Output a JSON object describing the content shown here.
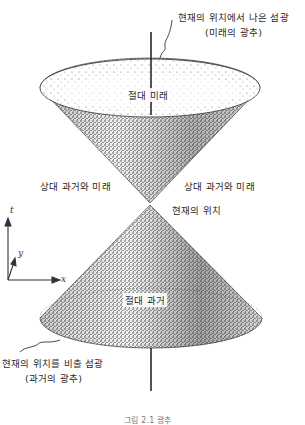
{
  "figure": {
    "labels": {
      "future_flash_line1": "현재의 위치에서 나온 섬광",
      "future_flash_line2": "(미래의 광추)",
      "absolute_future": "절대 미래",
      "relative_left": "상대 과거와 미래",
      "relative_right": "상대 과거와 미래",
      "present_position": "현재의 위치",
      "absolute_past": "절대 과거",
      "past_flash_line1": "현재의 위치를 비출 섬광",
      "past_flash_line2": "(과거의 광추)",
      "caption": "그림 2.1 광추"
    },
    "axes": {
      "t": "t",
      "y": "y",
      "x": "x"
    },
    "colors": {
      "ink": "#2a2a2a",
      "background": "#ffffff"
    }
  }
}
